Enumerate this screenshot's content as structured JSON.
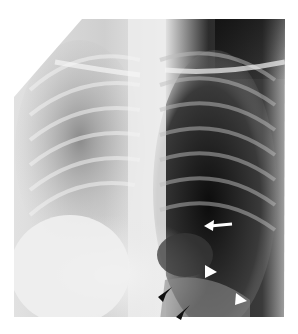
{
  "figure": {
    "type": "chest-radiograph",
    "view": "frontal",
    "annotations": [
      {
        "name": "white-arrow",
        "color": "#ffffff",
        "direction": "left",
        "x": 218,
        "y": 225
      },
      {
        "name": "white-arrowhead-upper",
        "color": "#ffffff",
        "direction": "right",
        "x": 210,
        "y": 272
      },
      {
        "name": "white-arrowhead-lower",
        "color": "#ffffff",
        "direction": "right",
        "x": 241,
        "y": 300
      },
      {
        "name": "black-arrowhead-upper",
        "color": "#111111",
        "direction": "down-left",
        "x": 163,
        "y": 292
      },
      {
        "name": "black-arrowhead-lower",
        "color": "#111111",
        "direction": "down-left",
        "x": 181,
        "y": 312
      }
    ]
  }
}
